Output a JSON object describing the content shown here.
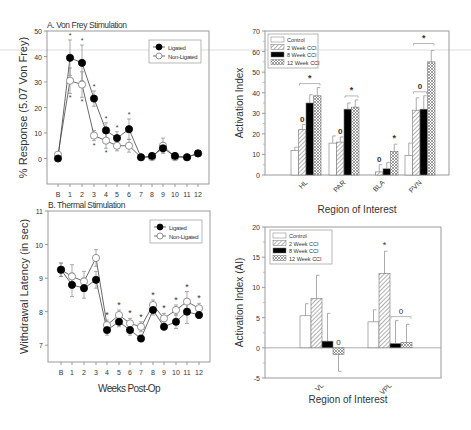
{
  "chart_data": [
    {
      "id": "A",
      "type": "line",
      "title": "A. Von Frey Stimulation",
      "xlabel": "",
      "ylabel": "% Response (5.07 Von Frey)",
      "ylim": [
        -10,
        50
      ],
      "yticks": [
        0,
        10,
        20,
        30,
        40,
        50
      ],
      "categories": [
        "B",
        "1",
        "2",
        "3",
        "4",
        "5",
        "6",
        "7",
        "8",
        "9",
        "10",
        "11",
        "12"
      ],
      "legend": {
        "position": "upper-right",
        "entries": [
          "Ligated",
          "Non-Ligated"
        ]
      },
      "series": [
        {
          "name": "Ligated",
          "marker": "filled-circle",
          "values": [
            0,
            39.5,
            37.5,
            23.5,
            11,
            8,
            11.5,
            0.5,
            1,
            4,
            1,
            0.5,
            2
          ],
          "errors": [
            0,
            7,
            7,
            3,
            3,
            2.5,
            4,
            0,
            0,
            1.5,
            0,
            0,
            0
          ]
        },
        {
          "name": "Non-Ligated",
          "marker": "open-circle",
          "values": [
            1.5,
            30.5,
            29,
            9,
            7,
            5,
            5,
            0.5,
            0.5,
            5,
            0.5,
            0.5,
            2
          ],
          "errors": [
            0,
            5,
            5,
            2,
            3,
            2,
            2.5,
            0,
            0,
            3,
            0,
            0,
            0
          ]
        }
      ],
      "annotations": [
        "*"
      ],
      "sig_top": [
        1,
        2,
        3,
        4,
        5,
        6
      ],
      "sig_bottom": [
        1,
        2,
        3,
        4
      ]
    },
    {
      "id": "B",
      "type": "line",
      "title": "B. Thermal Stimulation",
      "xlabel": "Weeks Post-Op",
      "ylabel": "Withdrawal Latency (in sec)",
      "ylim": [
        6.5,
        11
      ],
      "yticks": [
        7,
        8,
        9,
        10,
        11
      ],
      "categories": [
        "B",
        "1",
        "2",
        "3",
        "4",
        "5",
        "6",
        "7",
        "8",
        "9",
        "10",
        "11",
        "12"
      ],
      "legend": {
        "position": "upper-right",
        "entries": [
          "Ligated",
          "Non-Ligated"
        ]
      },
      "series": [
        {
          "name": "Ligated",
          "marker": "filled-circle",
          "values": [
            9.25,
            8.8,
            8.7,
            8.95,
            7.45,
            7.7,
            7.45,
            7.2,
            8.05,
            7.55,
            7.7,
            8.0,
            7.9
          ],
          "errors": [
            0.2,
            0.35,
            0.3,
            0.25,
            0.15,
            0.15,
            0.15,
            0.1,
            0.15,
            0.1,
            0.2,
            0.35,
            0.1
          ]
        },
        {
          "name": "Non-Ligated",
          "marker": "open-circle",
          "values": [
            9.25,
            9.05,
            8.9,
            9.6,
            7.6,
            7.9,
            7.65,
            7.55,
            8.2,
            7.8,
            8.05,
            8.3,
            8.1
          ],
          "errors": [
            0.2,
            0.35,
            0.3,
            0.25,
            0.15,
            0.15,
            0.15,
            0.15,
            0.15,
            0.15,
            0.15,
            0.3,
            0.15
          ]
        }
      ],
      "annotations": [
        "*"
      ],
      "sig_top": [
        4,
        5,
        6,
        7,
        8,
        9,
        10,
        11,
        12
      ]
    },
    {
      "id": "C",
      "type": "bar",
      "title": "",
      "xlabel": "Region of Interest",
      "ylabel": "Activation Index",
      "ylim": [
        0,
        70
      ],
      "yticks": [
        0,
        10,
        20,
        30,
        40,
        50,
        60,
        70
      ],
      "categories": [
        "HL",
        "PAR",
        "BLA",
        "PVN"
      ],
      "legend": {
        "position": "upper-left",
        "entries": [
          "Control",
          "2 Week CCI",
          "8 Week CCI",
          "12 Week CCI"
        ]
      },
      "series": [
        {
          "name": "Control",
          "values": [
            12,
            15.5,
            0,
            9.5
          ],
          "errors": [
            1.5,
            3.5,
            0,
            6
          ]
        },
        {
          "name": "2 Week CCI",
          "values": [
            22,
            16,
            1.5,
            31.5
          ],
          "errors": [
            2.5,
            2.5,
            3.5,
            6
          ]
        },
        {
          "name": "8 Week CCI",
          "values": [
            35,
            32,
            3,
            32
          ],
          "errors": [
            4,
            3,
            3,
            6.5
          ]
        },
        {
          "name": "12 Week CCI",
          "values": [
            38.5,
            33,
            11.5,
            55
          ],
          "errors": [
            4,
            3.5,
            3.5,
            5.5
          ]
        }
      ],
      "annotations": [
        {
          "category": "HL",
          "label": "0",
          "over": "2 Week CCI"
        },
        {
          "category": "HL",
          "label": "*",
          "bracket": [
            "2 Week CCI",
            "12 Week CCI"
          ]
        },
        {
          "category": "PAR",
          "label": "0",
          "over": "2 Week CCI"
        },
        {
          "category": "PAR",
          "label": "*",
          "bracket": [
            "8 Week CCI",
            "12 Week CCI"
          ]
        },
        {
          "category": "BLA",
          "label": "0",
          "over": "2 Week CCI"
        },
        {
          "category": "BLA",
          "label": "*",
          "over": "12 Week CCI"
        },
        {
          "category": "PVN",
          "label": "0",
          "bracket": [
            "2 Week CCI",
            "8 Week CCI"
          ]
        },
        {
          "category": "PVN",
          "label": "*",
          "bracket": [
            "2 Week CCI",
            "12 Week CCI"
          ]
        }
      ]
    },
    {
      "id": "D",
      "type": "bar",
      "title": "",
      "xlabel": "Region of Interest",
      "ylabel": "Activation Index (AI)",
      "ylim": [
        -5,
        20
      ],
      "yticks": [
        -5,
        0,
        5,
        10,
        15,
        20
      ],
      "categories": [
        "VL",
        "VPL"
      ],
      "legend": {
        "position": "upper-left",
        "entries": [
          "Control",
          "2 Week CCI",
          "8 Week CCI",
          "12 Week CCI"
        ]
      },
      "series": [
        {
          "name": "Control",
          "values": [
            5.3,
            4.3
          ],
          "errors": [
            2,
            2
          ]
        },
        {
          "name": "2 Week CCI",
          "values": [
            8.2,
            12.3
          ],
          "errors": [
            3.8,
            3.7
          ]
        },
        {
          "name": "8 Week CCI",
          "values": [
            1.1,
            0.7
          ],
          "errors": [
            4.6,
            3.8
          ]
        },
        {
          "name": "12 Week CCI",
          "values": [
            -1.1,
            0.9
          ],
          "errors": [
            2.8,
            3
          ]
        }
      ],
      "annotations": [
        {
          "category": "VL",
          "label": "0",
          "over": "12 Week CCI"
        },
        {
          "category": "VPL",
          "label": "*",
          "over": "2 Week CCI"
        },
        {
          "category": "VPL",
          "label": "0",
          "bracket": [
            "8 Week CCI",
            "12 Week CCI"
          ]
        }
      ]
    }
  ]
}
